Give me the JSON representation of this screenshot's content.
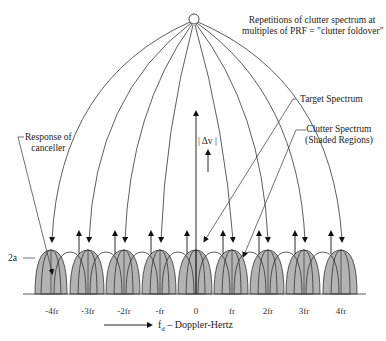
{
  "title_note": {
    "line1": "Repetitions of clutter spectrum at",
    "line2": "multiples of PRF = \"clutter foldover\""
  },
  "labels": {
    "target_spectrum": "Target Spectrum",
    "clutter_line1": "Clutter Spectrum",
    "clutter_line2": "(Shaded Regions)",
    "response_line1": "Response of",
    "response_line2": "canceller",
    "delta_v": "| Δv |",
    "two_a": "2a",
    "axis_label_f": "f",
    "axis_label_sub": "d",
    "axis_label_rest": " – Doppler-Hertz"
  },
  "ticks": [
    "-4fr",
    "-3fr",
    "-2fr",
    "-fr",
    "0",
    "fr",
    "2fr",
    "3fr",
    "4fr"
  ],
  "colors": {
    "shade": "#b3b3b3",
    "line": "#333333",
    "background": "#ffffff"
  }
}
